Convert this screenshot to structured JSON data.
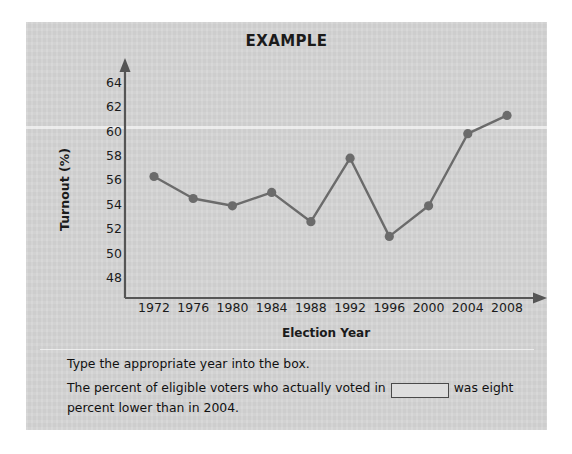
{
  "card": {
    "background_color": "#d5d5d5"
  },
  "chart_data": {
    "type": "line",
    "title": "EXAMPLE",
    "xlabel": "Election Year",
    "ylabel": "Turnout (%)",
    "categories": [
      "1972",
      "1976",
      "1980",
      "1984",
      "1988",
      "1992",
      "1996",
      "2000",
      "2004",
      "2008"
    ],
    "values": [
      56.4,
      54.6,
      54.0,
      55.1,
      52.7,
      57.9,
      51.5,
      54.0,
      59.9,
      61.4
    ],
    "yticks": [
      "64",
      "62",
      "60",
      "58",
      "56",
      "54",
      "52",
      "50",
      "48"
    ],
    "ytick_values": [
      64,
      62,
      60,
      58,
      56,
      54,
      52,
      50,
      48
    ],
    "ylim": [
      46.7,
      65.2
    ],
    "grid": false,
    "legend": null,
    "series_color": "#6b6b6b",
    "marker": "circle"
  },
  "instructions": {
    "line1": "Type the appropriate year into the box.",
    "line2_before": "The percent of eligible voters who actually voted in",
    "answer_value": "",
    "answer_placeholder": "",
    "line2_after": "was eight percent lower than in 2004."
  }
}
